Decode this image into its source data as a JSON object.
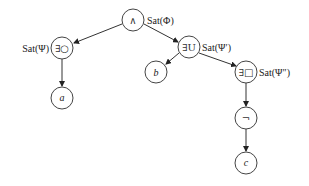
{
  "diagram": {
    "type": "syntax-tree",
    "nodes": {
      "root": {
        "symbol": "∧",
        "annotation": "Sat(Φ)"
      },
      "exists_next": {
        "symbol": "∃○",
        "annotation": "Sat(Ψ)"
      },
      "a": {
        "symbol": "a"
      },
      "exists_until": {
        "symbol": "∃U",
        "annotation": "Sat(Ψ′)"
      },
      "b": {
        "symbol": "b"
      },
      "exists_always": {
        "symbol": "∃□",
        "annotation": "Sat(Ψ″)"
      },
      "not": {
        "symbol": "¬"
      },
      "c": {
        "symbol": "c"
      }
    },
    "edges": [
      [
        "root",
        "exists_next"
      ],
      [
        "root",
        "exists_until"
      ],
      [
        "exists_next",
        "a"
      ],
      [
        "exists_until",
        "b"
      ],
      [
        "exists_until",
        "exists_always"
      ],
      [
        "exists_always",
        "not"
      ],
      [
        "not",
        "c"
      ]
    ]
  }
}
